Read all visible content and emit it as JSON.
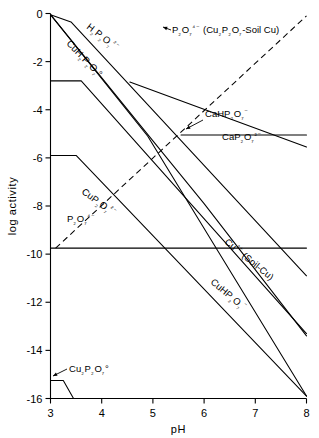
{
  "chart_data": {
    "type": "line",
    "title": "",
    "xlabel": "pH",
    "ylabel": "log activity",
    "xlim": [
      3,
      8
    ],
    "ylim": [
      -16,
      0
    ],
    "xticks": [
      3,
      4,
      5,
      6,
      7,
      8
    ],
    "yticks": [
      0,
      -2,
      -4,
      -6,
      -8,
      -10,
      -12,
      -14,
      -16
    ],
    "xticklabels": [
      "3",
      "4",
      "5",
      "6",
      "7",
      "8"
    ],
    "yticklabels": [
      "0",
      "-2",
      "-4",
      "-6",
      "-8",
      "-10",
      "-12",
      "-14",
      "-16"
    ],
    "grid": false,
    "legend": "none",
    "series": [
      {
        "name": "H2P2O7 2-",
        "label": "H₂P₂O₇²⁻",
        "style": "solid",
        "points": [
          [
            3.0,
            -0.05
          ],
          [
            3.4,
            -0.35
          ],
          [
            8.0,
            -10.9
          ]
        ]
      },
      {
        "name": "CuH2P2O7 0",
        "label": "CuH₂P₂O₇°",
        "style": "solid",
        "points": [
          [
            3.0,
            -2.8
          ],
          [
            3.6,
            -2.8
          ],
          [
            8.0,
            -13.3
          ]
        ]
      },
      {
        "name": "HP2O7 3-",
        "label": "",
        "style": "solid",
        "points": [
          [
            3.0,
            -0.05
          ],
          [
            4.9,
            -5.1
          ],
          [
            8.0,
            -15.9
          ]
        ]
      },
      {
        "name": "CuHP2O7 -",
        "label": "CuHP₂O₇⁻",
        "style": "solid",
        "points": [
          [
            3.0,
            -0.05
          ],
          [
            5.1,
            -5.55
          ],
          [
            6.0,
            -7.9
          ],
          [
            8.0,
            -13.4
          ]
        ]
      },
      {
        "name": "CuP2O7 2-",
        "label": "CuP₂O₇²⁻",
        "style": "solid",
        "points": [
          [
            3.0,
            -5.9
          ],
          [
            3.5,
            -5.9
          ],
          [
            8.0,
            -15.9
          ]
        ]
      },
      {
        "name": "P2O7 4-",
        "label": "P₂O₇⁴⁻",
        "style": "dashed",
        "points": [
          [
            3.1,
            -9.75
          ],
          [
            8.0,
            -0.1
          ]
        ]
      },
      {
        "name": "P2O7 4- soil plateau",
        "label": "",
        "style": "solid",
        "points": [
          [
            3.0,
            -9.75
          ],
          [
            8.0,
            -9.75
          ]
        ]
      },
      {
        "name": "CaP2O7 2-",
        "label": "CaP₂O₇²⁻",
        "style": "solid",
        "points": [
          [
            5.55,
            -5.05
          ],
          [
            8.0,
            -5.05
          ]
        ]
      },
      {
        "name": "CaHP2O7 -",
        "label": "CaHP₂O₇⁻",
        "style": "solid",
        "points": [
          [
            4.55,
            -2.85
          ],
          [
            8.0,
            -5.55
          ]
        ]
      },
      {
        "name": "Cu2P2O7 0",
        "label": "Cu₂P₂O₇°",
        "style": "solid",
        "points": [
          [
            3.0,
            -15.25
          ],
          [
            3.25,
            -15.25
          ],
          [
            3.45,
            -16.0
          ]
        ]
      }
    ],
    "annotations": [
      {
        "name": "p2o7-soil-cu-annotation",
        "text": "P₂O₇⁴⁻ (Cu₂P₂O₇-Soil Cu)",
        "x": 5.05,
        "y": -0.9
      },
      {
        "name": "cu2plus-soil-cu-annotation",
        "text": "Cu²⁺ (Soil-Cu)",
        "x": 6.25,
        "y": -10.5
      }
    ]
  },
  "axes": {
    "x_title": "pH",
    "y_title": "log activity"
  }
}
